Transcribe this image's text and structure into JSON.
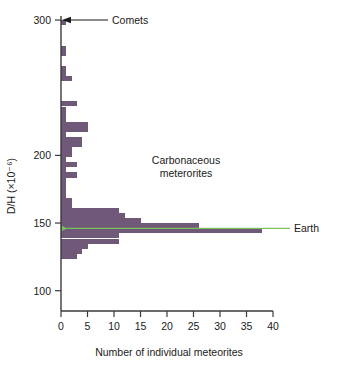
{
  "chart_data": {
    "type": "bar",
    "orientation": "horizontal",
    "title": "",
    "xlabel": "Number of individual meteorites",
    "ylabel": "D/H (×10⁻⁶)",
    "xlim": [
      0,
      40
    ],
    "ylim": [
      85,
      303
    ],
    "grid": false,
    "xticks": [
      0,
      5,
      10,
      15,
      20,
      25,
      30,
      35,
      40
    ],
    "xticklabels": [
      "0",
      "5",
      "10",
      "15",
      "20",
      "25",
      "30",
      "35",
      "40"
    ],
    "yticks": [
      100,
      150,
      200,
      300
    ],
    "yticklabels": [
      "100",
      "150",
      "200",
      "300"
    ],
    "bin_width": 3.75,
    "bar_color": "#6f5878",
    "bins": [
      {
        "y": 298.0,
        "value": 1
      },
      {
        "y": 294.2,
        "value": 0
      },
      {
        "y": 290.5,
        "value": 0
      },
      {
        "y": 286.7,
        "value": 0
      },
      {
        "y": 283.0,
        "value": 0
      },
      {
        "y": 279.2,
        "value": 1
      },
      {
        "y": 275.5,
        "value": 1
      },
      {
        "y": 271.7,
        "value": 0
      },
      {
        "y": 268.0,
        "value": 0
      },
      {
        "y": 264.2,
        "value": 1
      },
      {
        "y": 260.5,
        "value": 1
      },
      {
        "y": 256.7,
        "value": 2
      },
      {
        "y": 253.0,
        "value": 0
      },
      {
        "y": 249.2,
        "value": 0
      },
      {
        "y": 245.5,
        "value": 0
      },
      {
        "y": 241.7,
        "value": 0
      },
      {
        "y": 238.0,
        "value": 3
      },
      {
        "y": 234.2,
        "value": 1
      },
      {
        "y": 230.5,
        "value": 1
      },
      {
        "y": 226.7,
        "value": 1
      },
      {
        "y": 223.0,
        "value": 5
      },
      {
        "y": 219.2,
        "value": 5
      },
      {
        "y": 215.5,
        "value": 1
      },
      {
        "y": 211.7,
        "value": 4
      },
      {
        "y": 208.0,
        "value": 4
      },
      {
        "y": 204.2,
        "value": 2
      },
      {
        "y": 200.5,
        "value": 2
      },
      {
        "y": 196.7,
        "value": 1
      },
      {
        "y": 193.0,
        "value": 3
      },
      {
        "y": 189.2,
        "value": 1
      },
      {
        "y": 185.5,
        "value": 3
      },
      {
        "y": 181.7,
        "value": 1
      },
      {
        "y": 178.0,
        "value": 1
      },
      {
        "y": 174.2,
        "value": 1
      },
      {
        "y": 170.5,
        "value": 1
      },
      {
        "y": 166.7,
        "value": 2
      },
      {
        "y": 163.0,
        "value": 2
      },
      {
        "y": 159.2,
        "value": 11
      },
      {
        "y": 155.5,
        "value": 12
      },
      {
        "y": 151.7,
        "value": 15
      },
      {
        "y": 148.0,
        "value": 26
      },
      {
        "y": 144.2,
        "value": 38
      },
      {
        "y": 140.5,
        "value": 11
      },
      {
        "y": 136.7,
        "value": 11
      },
      {
        "y": 133.0,
        "value": 5
      },
      {
        "y": 129.2,
        "value": 4
      },
      {
        "y": 125.5,
        "value": 3
      },
      {
        "y": 121.7,
        "value": 0
      }
    ],
    "annotations": [
      {
        "name": "comets",
        "label": "Comets",
        "y_value": 300,
        "line_color": "#1a1a1a"
      },
      {
        "name": "earth",
        "label": "Earth",
        "y_value": 146,
        "line_color": "#7bbf5e"
      },
      {
        "name": "carbonaceous",
        "label_line1": "Carbonaceous",
        "label_line2": "meterorites"
      }
    ]
  }
}
